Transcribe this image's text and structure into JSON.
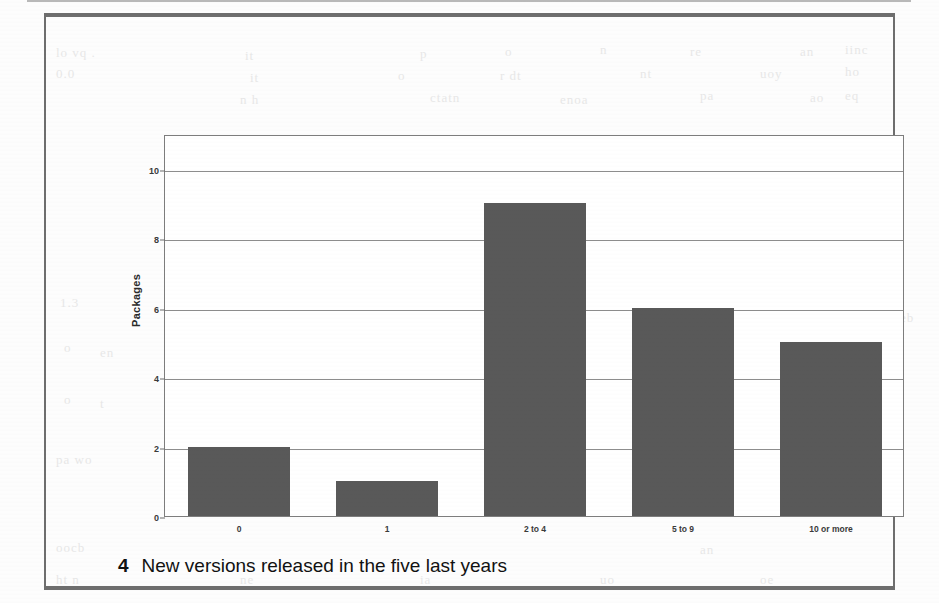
{
  "figure": {
    "caption_number": "4",
    "caption_text": "New versions released in the five last years"
  },
  "chart_data": {
    "type": "bar",
    "title": "",
    "subtitle": "",
    "xlabel": "",
    "ylabel": "Packages",
    "categories": [
      "0",
      "1",
      "2 to 4",
      "5 to 9",
      "10 or more"
    ],
    "values": [
      2,
      1,
      9,
      6,
      5
    ],
    "series": [
      {
        "name": "Packages",
        "values": [
          2,
          1,
          9,
          6,
          5
        ]
      }
    ],
    "ylim": [
      0,
      11
    ],
    "yticks": [
      0,
      2,
      4,
      6,
      8,
      10
    ],
    "ytick_labels": [
      "0",
      "2",
      "4",
      "6",
      "8",
      "10"
    ],
    "grid": true,
    "grid_axis": "y",
    "legend": false,
    "legend_position": "none",
    "bar_color": "#595959",
    "plot_background": "#ffffff",
    "gridline_color": "#8d8d8d",
    "axis_color": "#7d7d7d"
  },
  "bleed_through": [
    {
      "text": "lo  vq .",
      "x": 56,
      "y": 45
    },
    {
      "text": "it",
      "x": 245,
      "y": 48
    },
    {
      "text": "p",
      "x": 420,
      "y": 46
    },
    {
      "text": "o",
      "x": 505,
      "y": 44
    },
    {
      "text": "n",
      "x": 600,
      "y": 42
    },
    {
      "text": "re",
      "x": 690,
      "y": 44
    },
    {
      "text": "an",
      "x": 800,
      "y": 44
    },
    {
      "text": "iinc",
      "x": 845,
      "y": 42
    },
    {
      "text": "0.0",
      "x": 56,
      "y": 66
    },
    {
      "text": "it",
      "x": 250,
      "y": 70
    },
    {
      "text": "o",
      "x": 398,
      "y": 68
    },
    {
      "text": "r    dt",
      "x": 500,
      "y": 68
    },
    {
      "text": "nt",
      "x": 640,
      "y": 66
    },
    {
      "text": "uoy",
      "x": 760,
      "y": 66
    },
    {
      "text": "ho",
      "x": 845,
      "y": 64
    },
    {
      "text": "n h",
      "x": 240,
      "y": 92
    },
    {
      "text": "ctatn",
      "x": 430,
      "y": 90
    },
    {
      "text": "enoa",
      "x": 560,
      "y": 92
    },
    {
      "text": "pa",
      "x": 700,
      "y": 88
    },
    {
      "text": "ao",
      "x": 810,
      "y": 90
    },
    {
      "text": "eq",
      "x": 845,
      "y": 88
    },
    {
      "text": "e",
      "x": 790,
      "y": 148
    },
    {
      "text": "pu",
      "x": 845,
      "y": 150
    },
    {
      "text": "6",
      "x": 700,
      "y": 200
    },
    {
      "text": "p",
      "x": 800,
      "y": 205
    },
    {
      "text": "os",
      "x": 845,
      "y": 202
    },
    {
      "text": "n",
      "x": 250,
      "y": 205
    },
    {
      "text": "s",
      "x": 325,
      "y": 210
    },
    {
      "text": "oo",
      "x": 660,
      "y": 248
    },
    {
      "text": "p",
      "x": 760,
      "y": 250
    },
    {
      "text": "1.3",
      "x": 60,
      "y": 295
    },
    {
      "text": "a",
      "x": 250,
      "y": 300
    },
    {
      "text": "el",
      "x": 700,
      "y": 296
    },
    {
      "text": "ne",
      "x": 805,
      "y": 300
    },
    {
      "text": "n",
      "x": 600,
      "y": 330
    },
    {
      "text": "ie",
      "x": 690,
      "y": 338
    },
    {
      "text": "ao",
      "x": 795,
      "y": 332
    },
    {
      "text": "tb",
      "x": 845,
      "y": 334
    },
    {
      "text": "o",
      "x": 64,
      "y": 340
    },
    {
      "text": "en",
      "x": 100,
      "y": 345
    },
    {
      "text": "wv",
      "x": 385,
      "y": 396
    },
    {
      "text": "w",
      "x": 200,
      "y": 400
    },
    {
      "text": "ao",
      "x": 600,
      "y": 398
    },
    {
      "text": "ua",
      "x": 700,
      "y": 400
    },
    {
      "text": "iea",
      "x": 790,
      "y": 396
    },
    {
      "text": "o",
      "x": 64,
      "y": 392
    },
    {
      "text": "t",
      "x": 100,
      "y": 396
    },
    {
      "text": "pa   wo",
      "x": 56,
      "y": 452
    },
    {
      "text": "ea",
      "x": 240,
      "y": 452
    },
    {
      "text": "ne",
      "x": 700,
      "y": 450
    },
    {
      "text": "ro",
      "x": 800,
      "y": 452
    },
    {
      "text": "tb",
      "x": 848,
      "y": 450
    },
    {
      "text": "eb",
      "x": 900,
      "y": 310
    },
    {
      "text": "oocb",
      "x": 56,
      "y": 540
    },
    {
      "text": "an",
      "x": 700,
      "y": 542
    },
    {
      "text": "ht n",
      "x": 56,
      "y": 572
    },
    {
      "text": "ne",
      "x": 240,
      "y": 572
    },
    {
      "text": "ia",
      "x": 420,
      "y": 572
    },
    {
      "text": "uo",
      "x": 600,
      "y": 572
    },
    {
      "text": "oe",
      "x": 760,
      "y": 572
    }
  ]
}
